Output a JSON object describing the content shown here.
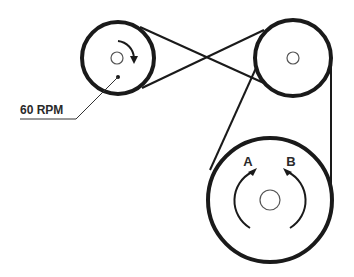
{
  "diagram": {
    "type": "belt-pulley-system",
    "colors": {
      "line": "#1a1a1a",
      "hub": "#555555",
      "background": "#ffffff"
    },
    "pulleys": [
      {
        "id": "small-drive",
        "cx": 118,
        "cy": 58,
        "r": 36,
        "hub_r": 6,
        "label": "60 RPM"
      },
      {
        "id": "top-right",
        "cx": 293,
        "cy": 58,
        "r": 38,
        "hub_r": 6
      },
      {
        "id": "large",
        "cx": 270,
        "cy": 200,
        "r": 62,
        "hub_r": 10
      }
    ],
    "belts": [
      {
        "name": "crossed-belt",
        "connects": [
          "small-drive",
          "top-right"
        ],
        "crossed": true
      },
      {
        "name": "open-belt",
        "connects": [
          "top-right",
          "large"
        ],
        "crossed": false
      }
    ],
    "labels": {
      "speed": "60 RPM",
      "direction_a": "A",
      "direction_b": "B"
    }
  }
}
